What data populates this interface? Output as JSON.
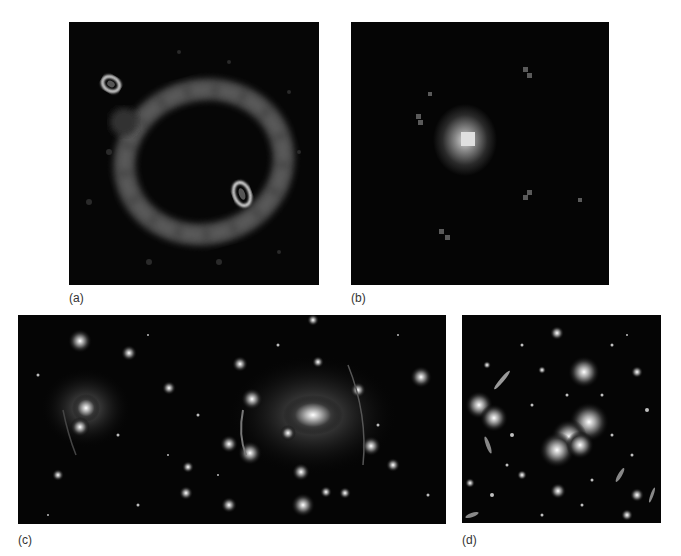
{
  "figure": {
    "panels": [
      {
        "id": "a",
        "label": "(a)",
        "description": "Einstein ring with two bright lensed images"
      },
      {
        "id": "b",
        "label": "(b)",
        "description": "Pixelated point source image"
      },
      {
        "id": "c",
        "label": "(c)",
        "description": "Galaxy cluster with gravitational arcs, wide field"
      },
      {
        "id": "d",
        "label": "(d)",
        "description": "Galaxy cluster with gravitational lensing arcs"
      }
    ]
  }
}
